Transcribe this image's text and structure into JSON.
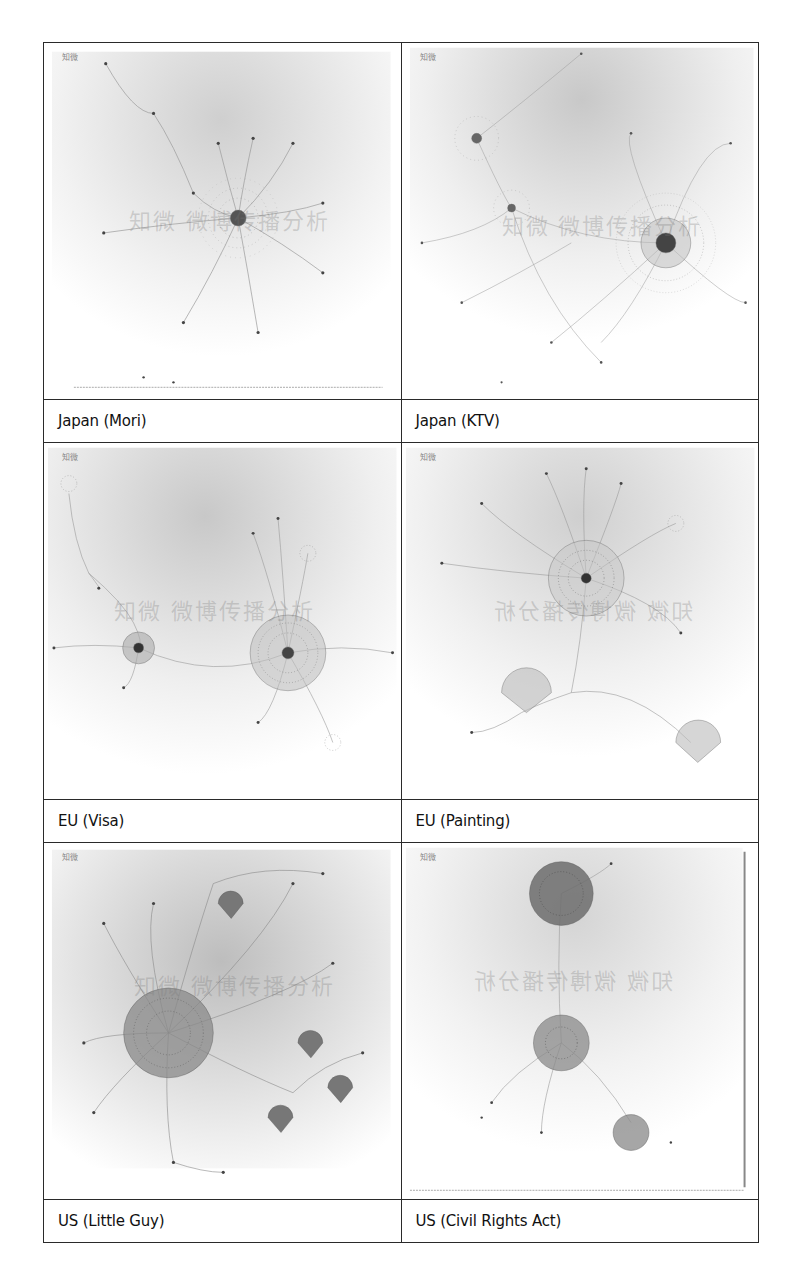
{
  "figure": {
    "logo_text": "知微",
    "watermark_text": "知微 微博传播分析",
    "panels": [
      {
        "label": "Japan (Mori)",
        "style": "single-hub"
      },
      {
        "label": "Japan (KTV)",
        "style": "dense-multi-hub"
      },
      {
        "label": "EU (Visa)",
        "style": "two-hubs"
      },
      {
        "label": "EU (Painting)",
        "style": "hub-with-subclusters"
      },
      {
        "label": "US (Little Guy)",
        "style": "giant-hub-many-branches"
      },
      {
        "label": "US (Civil Rights Act)",
        "style": "three-vertical-hubs"
      }
    ]
  }
}
